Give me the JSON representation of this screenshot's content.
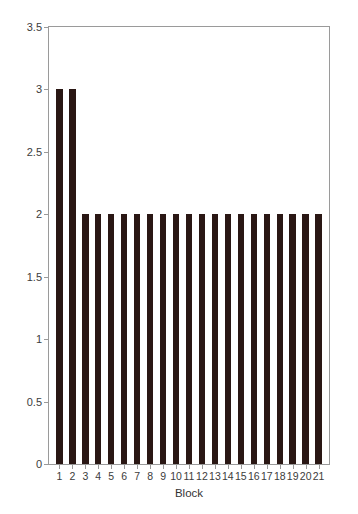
{
  "chart_data": {
    "type": "bar",
    "title": "",
    "subtitle": "",
    "xlabel": "Block",
    "ylabel": "Median zero crossings",
    "categories": [
      "1",
      "2",
      "3",
      "4",
      "5",
      "6",
      "7",
      "8",
      "9",
      "10",
      "11",
      "12",
      "13",
      "14",
      "15",
      "16",
      "17",
      "18",
      "19",
      "20",
      "21"
    ],
    "values": [
      3,
      3,
      2,
      2,
      2,
      2,
      2,
      2,
      2,
      2,
      2,
      2,
      2,
      2,
      2,
      2,
      2,
      2,
      2,
      2,
      2
    ],
    "series": [
      {
        "name": "Median zero crossings",
        "values": [
          3,
          3,
          2,
          2,
          2,
          2,
          2,
          2,
          2,
          2,
          2,
          2,
          2,
          2,
          2,
          2,
          2,
          2,
          2,
          2,
          2
        ]
      }
    ],
    "ylim": [
      0,
      3.5
    ],
    "yticks": [
      0,
      0.5,
      1,
      1.5,
      2,
      2.5,
      3,
      3.5
    ],
    "ytick_labels": [
      "0",
      "0.5",
      "1",
      "1.5",
      "2",
      "2.5",
      "3",
      "3.5"
    ],
    "xticks": [
      1,
      2,
      3,
      4,
      5,
      6,
      7,
      8,
      9,
      10,
      11,
      12,
      13,
      14,
      15,
      16,
      17,
      18,
      19,
      20,
      21
    ],
    "xtick_labels": [
      "1",
      "2",
      "3",
      "4",
      "5",
      "6",
      "7",
      "8",
      "9",
      "10",
      "11",
      "12",
      "13",
      "14",
      "15",
      "16",
      "17",
      "18",
      "19",
      "20",
      "21"
    ],
    "grid": false,
    "legend": false,
    "legend_position": "none",
    "bar_color": "#2a1714",
    "frame_color": "#9a9a9a",
    "background_color": "#ffffff",
    "annotations": []
  }
}
